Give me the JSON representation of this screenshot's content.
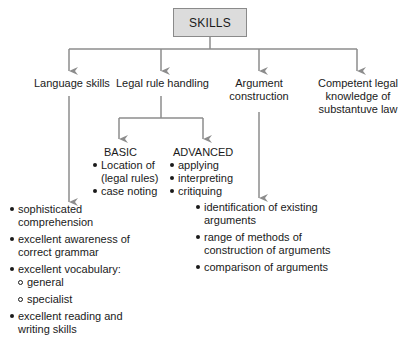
{
  "colors": {
    "connector": "#8c8c8c",
    "root_fill": "#dcdcdc",
    "root_border": "#8a8a8a",
    "text": "#1a1a1a"
  },
  "root": {
    "label": "SKILLS"
  },
  "categories": [
    {
      "id": "language",
      "label": "Language skills",
      "items": [
        {
          "line1": "sophisticated",
          "line2": "comprehension"
        },
        {
          "line1": "excellent awareness of",
          "line2": "correct grammar"
        },
        {
          "line1": "excellent vocabulary:",
          "sub": [
            "general",
            "specialist"
          ]
        },
        {
          "line1": "excellent reading and",
          "line2": "writing skills"
        }
      ]
    },
    {
      "id": "legal-rule",
      "label": "Legal rule handling",
      "children": [
        {
          "label": "BASIC",
          "items": [
            {
              "line1": "Location of",
              "line2": "(legal rules)"
            },
            {
              "line1": "case noting"
            }
          ]
        },
        {
          "label": "ADVANCED",
          "items": [
            {
              "line1": "applying"
            },
            {
              "line1": "interpreting"
            },
            {
              "line1": "critiquing"
            }
          ]
        }
      ]
    },
    {
      "id": "argument",
      "label_line1": "Argument",
      "label_line2": "construction",
      "items": [
        {
          "line1": "identification of existing",
          "line2": "arguments"
        },
        {
          "line1": "range of methods of",
          "line2": "construction of arguments"
        },
        {
          "line1": "comparison of arguments"
        }
      ]
    },
    {
      "id": "substantive",
      "label_line1": "Competent legal",
      "label_line2": "knowledge of",
      "label_line3": "substantuve law"
    }
  ]
}
